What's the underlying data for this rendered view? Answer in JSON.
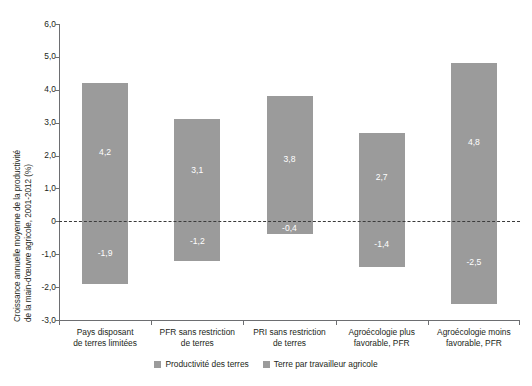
{
  "chart_data": {
    "type": "bar",
    "title": "",
    "subtitle": "",
    "xlabel": "",
    "ylabel_line1": "Croissance annuelle moyenne de la productivité",
    "ylabel_line2": "de la main-d'œuvre agricole, 2001-2012 (%)",
    "ylim": [
      -3.0,
      6.0
    ],
    "yticks": [
      "6,0",
      "5,0",
      "4,0",
      "3,0",
      "2,0",
      "1,0",
      "0",
      "-1,0",
      "-2,0",
      "-3,0"
    ],
    "ytick_values": [
      6.0,
      5.0,
      4.0,
      3.0,
      2.0,
      1.0,
      0,
      -1.0,
      -2.0,
      -3.0
    ],
    "grid": false,
    "zero_line": true,
    "legend_position": "bottom",
    "bar_color": "#9b9b9b",
    "categories": [
      {
        "line1": "Pays disposant",
        "line2": "de terres limitées"
      },
      {
        "line1": "PFR sans restriction",
        "line2": "de terres"
      },
      {
        "line1": "PRI sans restriction",
        "line2": "de terres"
      },
      {
        "line1": "Agroécologie plus",
        "line2": "favorable, PFR"
      },
      {
        "line1": "Agroécologie moins",
        "line2": "favorable, PFR"
      }
    ],
    "series": [
      {
        "name": "Productivité des terres",
        "values": [
          4.2,
          3.1,
          3.8,
          2.7,
          4.8
        ],
        "labels": [
          "4,2",
          "3,1",
          "3,8",
          "2,7",
          "4,8"
        ]
      },
      {
        "name": "Terre par travailleur agricole",
        "values": [
          -1.9,
          -1.2,
          -0.4,
          -1.4,
          -2.5
        ],
        "labels": [
          "-1,9",
          "-1,2",
          "-0,4",
          "-1,4",
          "-2,5"
        ]
      }
    ],
    "legend": [
      {
        "label": "Productivité des terres",
        "color": "#9b9b9b"
      },
      {
        "label": "Terre par travailleur agricole",
        "color": "#9b9b9b"
      }
    ]
  }
}
